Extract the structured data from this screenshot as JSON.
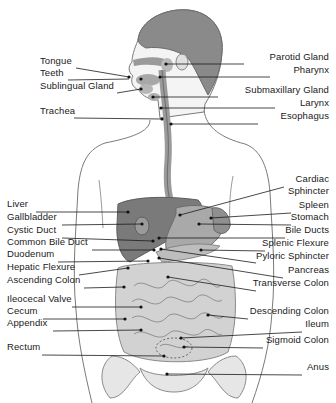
{
  "figure": {
    "type": "anatomical-diagram",
    "colors": {
      "ink": "#1a1a1a",
      "organ_dark": "#6e6e6e",
      "organ_mid": "#a3a3a3",
      "organ_light": "#cfcfcf",
      "skin_outline": "#7a7a7a"
    }
  },
  "labels_left": [
    {
      "text": "Tongue",
      "x": 40,
      "y": 64
    },
    {
      "text": "Teeth",
      "x": 40,
      "y": 76
    },
    {
      "text": "Sublingual Gland",
      "x": 40,
      "y": 89
    },
    {
      "text": "Trachea",
      "x": 40,
      "y": 114
    },
    {
      "text": "Liver",
      "x": 7,
      "y": 207
    },
    {
      "text": "Gallbladder",
      "x": 7,
      "y": 220
    },
    {
      "text": "Cystic Duct",
      "x": 7,
      "y": 233
    },
    {
      "text": "Common Bile Duct",
      "x": 7,
      "y": 245
    },
    {
      "text": "Duodenum",
      "x": 7,
      "y": 257
    },
    {
      "text": "Hepatic Flexure",
      "x": 7,
      "y": 270
    },
    {
      "text": "Ascending Colon",
      "x": 7,
      "y": 283
    },
    {
      "text": "Ileocecal Valve",
      "x": 7,
      "y": 302
    },
    {
      "text": "Cecum",
      "x": 7,
      "y": 314
    },
    {
      "text": "Appendix",
      "x": 7,
      "y": 326
    },
    {
      "text": "Rectum",
      "x": 7,
      "y": 350
    }
  ],
  "labels_right": [
    {
      "text": "Parotid Gland",
      "x": 329,
      "y": 60
    },
    {
      "text": "Pharynx",
      "x": 329,
      "y": 73
    },
    {
      "text": "Submaxillary Gland",
      "x": 329,
      "y": 93
    },
    {
      "text": "Larynx",
      "x": 329,
      "y": 106
    },
    {
      "text": "Esophagus",
      "x": 329,
      "y": 119
    },
    {
      "text": "Cardiac",
      "x": 329,
      "y": 182
    },
    {
      "text": "Sphincter",
      "x": 329,
      "y": 194
    },
    {
      "text": "Spleen",
      "x": 329,
      "y": 208
    },
    {
      "text": "Stomach",
      "x": 329,
      "y": 220
    },
    {
      "text": "Bile Ducts",
      "x": 329,
      "y": 233
    },
    {
      "text": "Splenic Flexure",
      "x": 329,
      "y": 246
    },
    {
      "text": "Pyloric Sphincter",
      "x": 329,
      "y": 259
    },
    {
      "text": "Pancreas",
      "x": 329,
      "y": 273
    },
    {
      "text": "Transverse Colon",
      "x": 329,
      "y": 286
    },
    {
      "text": "Descending Colon",
      "x": 329,
      "y": 314
    },
    {
      "text": "Ileum",
      "x": 329,
      "y": 327
    },
    {
      "text": "Sigmoid Colon",
      "x": 329,
      "y": 343
    },
    {
      "text": "Anus",
      "x": 329,
      "y": 370
    }
  ],
  "leaders": [
    {
      "x1": 76,
      "y1": 68,
      "x2": 129,
      "y2": 77,
      "dot": [
        129,
        77
      ]
    },
    {
      "x1": 68,
      "y1": 80,
      "x2": 129,
      "y2": 79,
      "dot": [
        141,
        79
      ]
    },
    {
      "x1": 117,
      "y1": 93,
      "x2": 141,
      "y2": 89,
      "dot": [
        141,
        89
      ]
    },
    {
      "x1": 74,
      "y1": 118,
      "x2": 162,
      "y2": 119,
      "dot": [
        162,
        119
      ]
    },
    {
      "x1": 166,
      "y1": 64,
      "x2": 244,
      "y2": 64,
      "dot": [
        166,
        64
      ]
    },
    {
      "x1": 160,
      "y1": 77,
      "x2": 270,
      "y2": 77,
      "dot": [
        160,
        77
      ]
    },
    {
      "x1": 153,
      "y1": 97,
      "x2": 218,
      "y2": 97,
      "dot": [
        153,
        97
      ]
    },
    {
      "x1": 161,
      "y1": 108,
      "x2": 275,
      "y2": 108,
      "dot": [
        161,
        108
      ]
    },
    {
      "x1": 171,
      "y1": 124,
      "x2": 258,
      "y2": 124,
      "dot": [
        171,
        124
      ]
    },
    {
      "x1": 36,
      "y1": 212,
      "x2": 128,
      "y2": 212,
      "dot": [
        128,
        212
      ]
    },
    {
      "x1": 62,
      "y1": 225,
      "x2": 142,
      "y2": 224,
      "dot": [
        142,
        224
      ]
    },
    {
      "x1": 62,
      "y1": 238,
      "x2": 153,
      "y2": 241,
      "dot": [
        153,
        241
      ]
    },
    {
      "x1": 92,
      "y1": 250,
      "x2": 154,
      "y2": 250,
      "dot": [
        154,
        250
      ]
    },
    {
      "x1": 58,
      "y1": 262,
      "x2": 148,
      "y2": 261,
      "dot": [
        148,
        261
      ]
    },
    {
      "x1": 79,
      "y1": 275,
      "x2": 128,
      "y2": 268,
      "dot": [
        128,
        268
      ]
    },
    {
      "x1": 84,
      "y1": 288,
      "x2": 124,
      "y2": 287,
      "dot": [
        124,
        287
      ]
    },
    {
      "x1": 72,
      "y1": 307,
      "x2": 141,
      "y2": 307,
      "dot": [
        141,
        307
      ]
    },
    {
      "x1": 43,
      "y1": 319,
      "x2": 125,
      "y2": 319,
      "dot": [
        125,
        319
      ]
    },
    {
      "x1": 53,
      "y1": 331,
      "x2": 141,
      "y2": 330,
      "dot": [
        141,
        330
      ]
    },
    {
      "x1": 42,
      "y1": 355,
      "x2": 164,
      "y2": 356,
      "dot": [
        164,
        356
      ]
    },
    {
      "x1": 180,
      "y1": 215,
      "x2": 284,
      "y2": 187,
      "dot": [
        180,
        215
      ]
    },
    {
      "x1": 211,
      "y1": 218,
      "x2": 291,
      "y2": 213,
      "dot": [
        211,
        218
      ]
    },
    {
      "x1": 199,
      "y1": 224,
      "x2": 291,
      "y2": 225,
      "dot": [
        199,
        224
      ]
    },
    {
      "x1": 159,
      "y1": 238,
      "x2": 285,
      "y2": 238,
      "dot": [
        159,
        238
      ]
    },
    {
      "x1": 201,
      "y1": 250,
      "x2": 265,
      "y2": 251,
      "dot": [
        201,
        250
      ]
    },
    {
      "x1": 161,
      "y1": 249,
      "x2": 256,
      "y2": 263,
      "dot": [
        161,
        249
      ]
    },
    {
      "x1": 159,
      "y1": 258,
      "x2": 283,
      "y2": 278,
      "dot": [
        159,
        258
      ]
    },
    {
      "x1": 168,
      "y1": 277,
      "x2": 256,
      "y2": 291,
      "dot": [
        168,
        277
      ]
    },
    {
      "x1": 208,
      "y1": 315,
      "x2": 248,
      "y2": 319,
      "dot": [
        208,
        315
      ]
    },
    {
      "x1": 181,
      "y1": 338,
      "x2": 302,
      "y2": 332,
      "dot": [
        181,
        338
      ]
    },
    {
      "x1": 184,
      "y1": 347,
      "x2": 263,
      "y2": 348,
      "dot": [
        184,
        347
      ]
    },
    {
      "x1": 167,
      "y1": 374,
      "x2": 302,
      "y2": 375,
      "dot": [
        167,
        374
      ]
    }
  ]
}
